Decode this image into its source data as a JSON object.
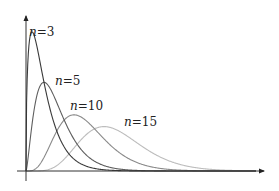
{
  "chart_data": {
    "type": "line",
    "title": "",
    "xlabel": "",
    "ylabel": "",
    "grid": false,
    "axes": {
      "x_arrow": true,
      "y_arrow": true,
      "ticks": false
    },
    "series": [
      {
        "name": "n = 3",
        "df": 3,
        "color": "#3a3a3a",
        "label": {
          "var": "n",
          "eq": "=",
          "val": "3"
        }
      },
      {
        "name": "n = 5",
        "df": 5,
        "color": "#5e5e5e",
        "label": {
          "var": "n",
          "eq": "=",
          "val": "5"
        }
      },
      {
        "name": "n = 10",
        "df": 10,
        "color": "#8a8a8a",
        "label": {
          "var": "n",
          "eq": "=",
          "val": "10"
        }
      },
      {
        "name": "n = 15",
        "df": 15,
        "color": "#bdbdbd",
        "label": {
          "var": "n",
          "eq": "=",
          "val": "15"
        }
      }
    ],
    "xlim": [
      0,
      40
    ],
    "ylim": [
      0,
      0.26
    ]
  },
  "layout": {
    "origin": {
      "x": 26,
      "y": 171
    },
    "x_axis_end": 264,
    "x_axis_start": 17,
    "y_axis_top": 16,
    "y_axis_bottom": 181,
    "x_scale_px_per_unit": 6.0,
    "y_scale_px_per_unit": 575,
    "label_positions": [
      {
        "x": 29,
        "y": 36
      },
      {
        "x": 55,
        "y": 85
      },
      {
        "x": 70,
        "y": 110
      },
      {
        "x": 124,
        "y": 126
      }
    ]
  }
}
